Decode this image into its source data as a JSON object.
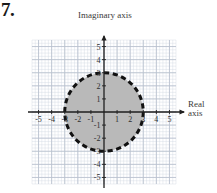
{
  "problem": {
    "number": "7."
  },
  "labels": {
    "imaginary_axis": "Imaginary axis",
    "real_axis_line1": "Real",
    "real_axis_line2": "axis"
  },
  "colors": {
    "fill": "#b9b9b9",
    "stroke": "#111111",
    "axis": "#1f1f1f",
    "grid_minor": "#cfd6e0",
    "grid_major": "#b9c2cf",
    "text": "#2e2e2e"
  },
  "chart_data": {
    "type": "scatter",
    "title": "",
    "xlabel": "Real axis",
    "ylabel": "Imaginary axis",
    "xlim": [
      -5.5,
      5.5
    ],
    "ylim": [
      -5.5,
      5.5
    ],
    "grid": true,
    "grid_minor_step": 0.25,
    "grid_major_step": 1,
    "legend": "none",
    "xticks": [
      -5,
      -4,
      -3,
      -2,
      -1,
      1,
      2,
      3,
      4,
      5
    ],
    "xtick_labels": [
      "-5",
      "-4",
      "-3",
      "-2",
      "-1",
      "1",
      "2",
      "3",
      "4",
      "5"
    ],
    "yticks": [
      5,
      4,
      3,
      2,
      1,
      -1,
      -2,
      -3,
      -4,
      -5
    ],
    "ytick_labels": [
      "5",
      "4",
      "3",
      "2",
      "1",
      "-1",
      "-2",
      "-3",
      "-4",
      "-5"
    ],
    "shapes": [
      {
        "kind": "circle",
        "center": [
          0,
          0
        ],
        "radius": 3,
        "fill": "#b9b9b9",
        "edge": "#111111",
        "linestyle": "dashed",
        "linewidth": 3,
        "description": "Shaded disk of radius 3 centered at the origin with dashed boundary (boundary excluded)"
      }
    ],
    "annotations": []
  }
}
